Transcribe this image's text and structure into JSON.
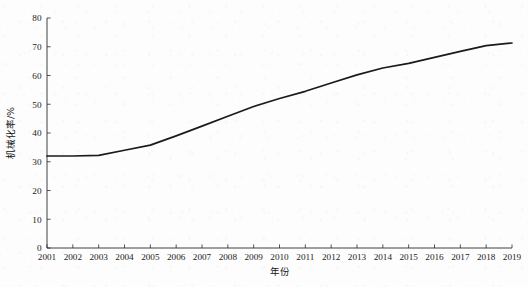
{
  "figure": {
    "background_color": "#fdfdfd",
    "line_color": "#1a1a1a",
    "axis_color": "#2b2b2b"
  },
  "axes": {
    "x_title": "年份",
    "y_title": "机械化率/%",
    "x_tick_labels": [
      "2001",
      "2002",
      "2003",
      "2004",
      "2005",
      "2006",
      "2007",
      "2008",
      "2009",
      "2010",
      "2011",
      "2012",
      "2013",
      "2014",
      "2015",
      "2016",
      "2017",
      "2018",
      "2019"
    ],
    "y_tick_labels": [
      "0",
      "10",
      "20",
      "30",
      "40",
      "50",
      "60",
      "70",
      "80"
    ]
  },
  "chart_data": {
    "type": "line",
    "title": "",
    "xlabel": "年份",
    "ylabel": "机械化率/%",
    "x": [
      2001,
      2002,
      2003,
      2004,
      2005,
      2006,
      2007,
      2008,
      2009,
      2010,
      2011,
      2012,
      2013,
      2014,
      2015,
      2016,
      2017,
      2018,
      2019
    ],
    "values": [
      32.0,
      32.0,
      32.2,
      34.0,
      35.8,
      39.0,
      42.4,
      45.8,
      49.2,
      52.0,
      54.5,
      57.4,
      60.2,
      62.6,
      64.2,
      66.3,
      68.4,
      70.4,
      71.3
    ],
    "series": [
      {
        "name": "机械化率",
        "values": [
          32.0,
          32.0,
          32.2,
          34.0,
          35.8,
          39.0,
          42.4,
          45.8,
          49.2,
          52.0,
          54.5,
          57.4,
          60.2,
          62.6,
          64.2,
          66.3,
          68.4,
          70.4,
          71.3
        ]
      }
    ],
    "categories": [
      "2001",
      "2002",
      "2003",
      "2004",
      "2005",
      "2006",
      "2007",
      "2008",
      "2009",
      "2010",
      "2011",
      "2012",
      "2013",
      "2014",
      "2015",
      "2016",
      "2017",
      "2018",
      "2019"
    ],
    "xlim": [
      2001,
      2019
    ],
    "ylim": [
      0,
      80
    ],
    "y_ticks": [
      0,
      10,
      20,
      30,
      40,
      50,
      60,
      70,
      80
    ],
    "grid": false,
    "legend": false,
    "legend_position": "none"
  }
}
